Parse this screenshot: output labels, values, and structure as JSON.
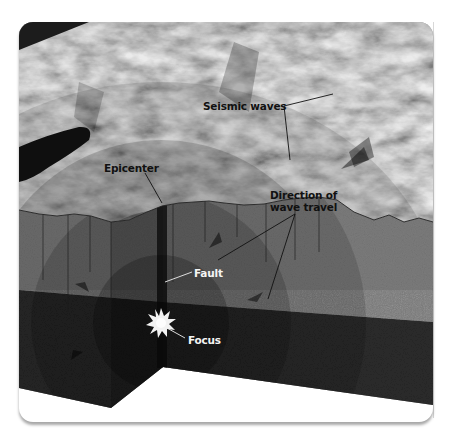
{
  "figure": {
    "type": "earthquake cross-section illustration",
    "colors": {
      "background": "#ffffff",
      "surface_light": "#bdbdbd",
      "surface_dark": "#5a5a5a",
      "crust": "#7a7a7a",
      "deep_layer": "#2a2a2a",
      "wave_shade": "#000000",
      "label_dark": "#111111",
      "label_light": "#f4f4f4",
      "focus_burst": "#f2f2f2"
    }
  },
  "labels": {
    "seismic_waves": "Seismic waves",
    "epicenter": "Epicenter",
    "direction_line1": "Direction of",
    "direction_line2": "wave travel",
    "fault": "Fault",
    "focus": "Focus"
  }
}
